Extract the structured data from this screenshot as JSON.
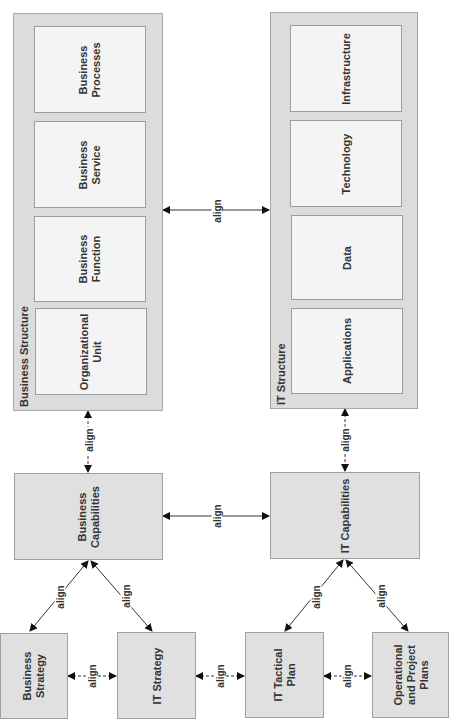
{
  "diagram": {
    "business_structure": {
      "title": "Business Structure",
      "items": [
        "Business\nProcesses",
        "Business\nService",
        "Business\nFunction",
        "Organizational\nUnit"
      ]
    },
    "it_structure": {
      "title": "IT Structure",
      "items": [
        "Infrastructure",
        "Technology",
        "Data",
        "Applications"
      ]
    },
    "capabilities": {
      "business": "Business\nCapabilities",
      "it": "IT Capabilities"
    },
    "plans": {
      "business_strategy": "Business\nStrategy",
      "it_strategy": "IT Strategy",
      "it_tactical_plan": "IT Tactical\nPlan",
      "operational": "Operational\nand Project\nPlans"
    },
    "relations": {
      "structure_to_structure": "align",
      "bizstruct_to_bizcap": "align",
      "itstruct_to_itcap": "align",
      "bizcap_to_itcap": "align",
      "bizcap_to_bizstrategy": "align",
      "bizcap_to_itstrategy": "align",
      "itcap_to_tactical": "align",
      "itcap_to_operational": "align",
      "bizstrategy_to_itstrategy": "align",
      "itstrategy_to_tactical": "align",
      "tactical_to_operational": "align"
    }
  }
}
